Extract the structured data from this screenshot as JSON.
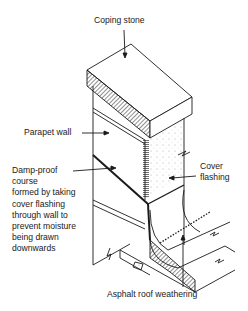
{
  "diagram": {
    "labels": {
      "coping_stone": "Coping stone",
      "parapet_wall": "Parapet wall",
      "damp_proof_course": "Damp-proof\ncourse\nformed by taking\ncover flashing\nthrough wall to\nprevent moisture\nbeing drawn\ndownwards",
      "cover_flashing": "Cover\nflashing",
      "asphalt_roof_weathering": "Asphalt roof weathering"
    },
    "colors": {
      "line": "#1a1a1a",
      "background": "#ffffff"
    }
  }
}
